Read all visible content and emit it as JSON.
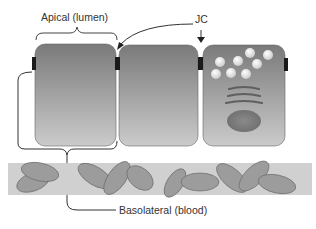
{
  "labels": {
    "apical": "Apical (lumen)",
    "junction": "JC",
    "basolateral": "Basolateral (blood)"
  },
  "colors": {
    "cell_top": "#7a7a7a",
    "cell_bottom": "#c9c9c9",
    "junction": "#1a1a1a",
    "blood_band": "#cfcfcf",
    "blood_cell": "#9a9a9a",
    "outline": "#555555"
  },
  "cells": [
    {
      "name": "epithelial-cell-1"
    },
    {
      "name": "epithelial-cell-2"
    },
    {
      "name": "secretory-cell-3",
      "vesicles": 8,
      "golgi_stacks": 3,
      "nucleus": 1
    }
  ]
}
